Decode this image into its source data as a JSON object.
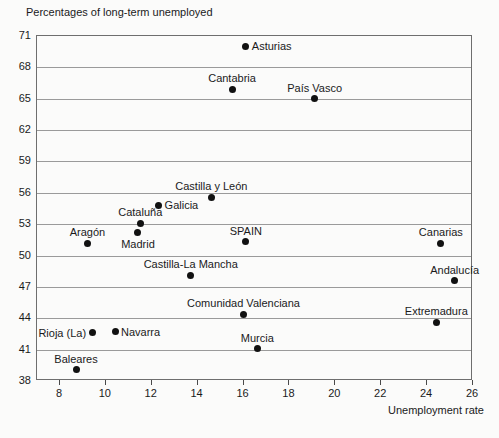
{
  "chart_data": {
    "type": "scatter",
    "title": "Percentages of long-term unemployed",
    "xlabel": "Unemployment rate",
    "ylabel": "Percentages of long-term unemployed",
    "xlim": [
      7,
      26
    ],
    "ylim": [
      38,
      71
    ],
    "xticks": [
      8,
      10,
      12,
      14,
      16,
      18,
      20,
      22,
      24,
      26
    ],
    "yticks": [
      38,
      41,
      44,
      47,
      50,
      53,
      56,
      59,
      62,
      65,
      68,
      71
    ],
    "grid": true,
    "legend": false,
    "point_color": "#111111",
    "points": [
      {
        "label": "Asturias",
        "x": 16.1,
        "y": 70.0,
        "label_pos": "right"
      },
      {
        "label": "Cantabria",
        "x": 15.5,
        "y": 65.9,
        "label_pos": "above"
      },
      {
        "label": "País Vasco",
        "x": 19.1,
        "y": 65.0,
        "label_pos": "above"
      },
      {
        "label": "Castilla y León",
        "x": 14.6,
        "y": 55.6,
        "label_pos": "above"
      },
      {
        "label": "Galicia",
        "x": 12.3,
        "y": 54.8,
        "label_pos": "right"
      },
      {
        "label": "Cataluña",
        "x": 11.5,
        "y": 53.1,
        "label_pos": "above"
      },
      {
        "label": "Madrid",
        "x": 11.4,
        "y": 52.2,
        "label_pos": "below"
      },
      {
        "label": "Aragón",
        "x": 9.2,
        "y": 51.2,
        "label_pos": "above"
      },
      {
        "label": "SPAIN",
        "x": 16.1,
        "y": 51.3,
        "label_pos": "above"
      },
      {
        "label": "Canarias",
        "x": 24.6,
        "y": 51.2,
        "label_pos": "above"
      },
      {
        "label": "Castilla-La Mancha",
        "x": 13.7,
        "y": 48.1,
        "label_pos": "above"
      },
      {
        "label": "Andalucía",
        "x": 25.2,
        "y": 47.6,
        "label_pos": "above"
      },
      {
        "label": "Comunidad Valenciana",
        "x": 16.0,
        "y": 44.4,
        "label_pos": "above"
      },
      {
        "label": "Extremadura",
        "x": 24.4,
        "y": 43.6,
        "label_pos": "above"
      },
      {
        "label": "Navarra",
        "x": 10.4,
        "y": 42.7,
        "label_pos": "right"
      },
      {
        "label": "Rioja (La)",
        "x": 9.4,
        "y": 42.6,
        "label_pos": "left"
      },
      {
        "label": "Murcia",
        "x": 16.6,
        "y": 41.1,
        "label_pos": "above"
      },
      {
        "label": "Baleares",
        "x": 8.7,
        "y": 39.1,
        "label_pos": "above"
      }
    ]
  }
}
